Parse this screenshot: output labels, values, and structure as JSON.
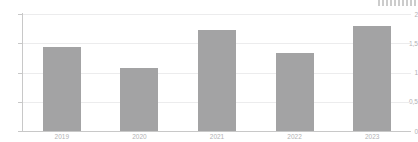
{
  "chart_data": {
    "type": "bar",
    "title": "",
    "subtitle": "",
    "xlabel": "",
    "ylabel": "",
    "categories": [
      "2019",
      "2020",
      "2021",
      "2022",
      "2023"
    ],
    "values": [
      1.43,
      1.07,
      1.72,
      1.34,
      1.79
    ],
    "series": [
      {
        "name": "",
        "values": [
          1.43,
          1.07,
          1.72,
          1.34,
          1.79
        ],
        "color": "#a3a3a4"
      }
    ],
    "ylim": [
      0,
      2
    ],
    "yticks": [
      0,
      0.5,
      1,
      1.5,
      2
    ],
    "ytick_labels": [
      "0",
      "0,5",
      "1",
      "1,5",
      "2"
    ],
    "xtick_labels": [
      "2019",
      "2020",
      "2021",
      "2022",
      "2023"
    ],
    "grid": true,
    "grid_axis": "y",
    "legend": false,
    "legend_position": "none",
    "decimal_separator": ",",
    "data_labels": false,
    "annotations": []
  },
  "style": {
    "bar_color": "#a3a3a4",
    "gridline_color": "#ececed",
    "axis_color": "#c8c8c8",
    "tick_label_color": "#b2b2b4",
    "background_color": "#ffffff"
  },
  "watermark": {
    "name": "watermark-strip",
    "legible": false,
    "text": ""
  }
}
